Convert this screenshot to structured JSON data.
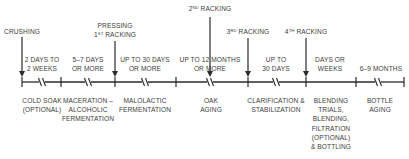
{
  "diagram": {
    "colors": {
      "line": "#2b2b2b",
      "text": "#3c3c3c",
      "background": "#ffffff"
    },
    "axis": {
      "y": 82,
      "x_start": 22,
      "x_end": 404
    },
    "ticks": [
      22,
      61,
      115,
      176,
      248,
      306,
      356,
      404
    ],
    "breaks": [
      42,
      88,
      145,
      210,
      276,
      378
    ],
    "events": [
      {
        "id": "crushing",
        "x": 22,
        "arrow_top": 37,
        "label_lines": [
          "CRUSHING"
        ],
        "label_top": 27
      },
      {
        "id": "pressing-1st-racking",
        "x": 115,
        "arrow_top": 41,
        "label_lines": [
          "PRESSING"
        ],
        "ordinal": {
          "num": "1",
          "sup": "ST",
          "text": " RACKING"
        },
        "label_top": 21
      },
      {
        "id": "2nd-racking",
        "x": 210,
        "arrow_top": 17,
        "ordinal": {
          "num": "2",
          "sup": "ND",
          "text": " RACKING"
        },
        "label_top": 4
      },
      {
        "id": "3rd-racking",
        "x": 248,
        "arrow_top": 38,
        "ordinal": {
          "num": "3",
          "sup": "RD",
          "text": " RACKING"
        },
        "label_top": 27
      },
      {
        "id": "4th-racking",
        "x": 306,
        "arrow_top": 38,
        "ordinal": {
          "num": "4",
          "sup": "TH",
          "text": " RACKING"
        },
        "label_top": 27
      }
    ],
    "durations": [
      {
        "x": 42,
        "lines": [
          "2 DAYS TO",
          "2 WEEKS"
        ]
      },
      {
        "x": 88,
        "lines": [
          "5–7 DAYS",
          "OR MORE"
        ]
      },
      {
        "x": 145,
        "lines": [
          "UP TO 30 DAYS",
          "OR MORE"
        ]
      },
      {
        "x": 210,
        "lines": [
          "UP TO 12 MONTHS",
          "OR MORE"
        ]
      },
      {
        "x": 276,
        "lines": [
          "UP TO",
          "30 DAYS"
        ]
      },
      {
        "x": 330,
        "lines": [
          "DAYS OR",
          "WEEKS"
        ]
      },
      {
        "x": 381,
        "lines": [
          "6–9 MONTHS"
        ]
      }
    ],
    "stages": [
      {
        "x": 42,
        "lines": [
          "COLD SOAK",
          "(OPTIONAL)"
        ]
      },
      {
        "x": 88,
        "lines": [
          "MACERATION –",
          "ALCOHOLIC",
          "FERMENTATION"
        ]
      },
      {
        "x": 145,
        "lines": [
          "MALOLACTIC",
          "FERMENTATION"
        ]
      },
      {
        "x": 211,
        "lines": [
          "OAK",
          "AGING"
        ]
      },
      {
        "x": 276,
        "lines": [
          "CLARIFICATION &",
          "STABILIZATION"
        ]
      },
      {
        "x": 331,
        "lines": [
          "BLENDING",
          "TRIALS,",
          "BLENDING,",
          "FILTRATION",
          "(OPTIONAL)",
          "& BOTTLING"
        ]
      },
      {
        "x": 380,
        "lines": [
          "BOTTLE",
          "AGING"
        ]
      }
    ]
  }
}
